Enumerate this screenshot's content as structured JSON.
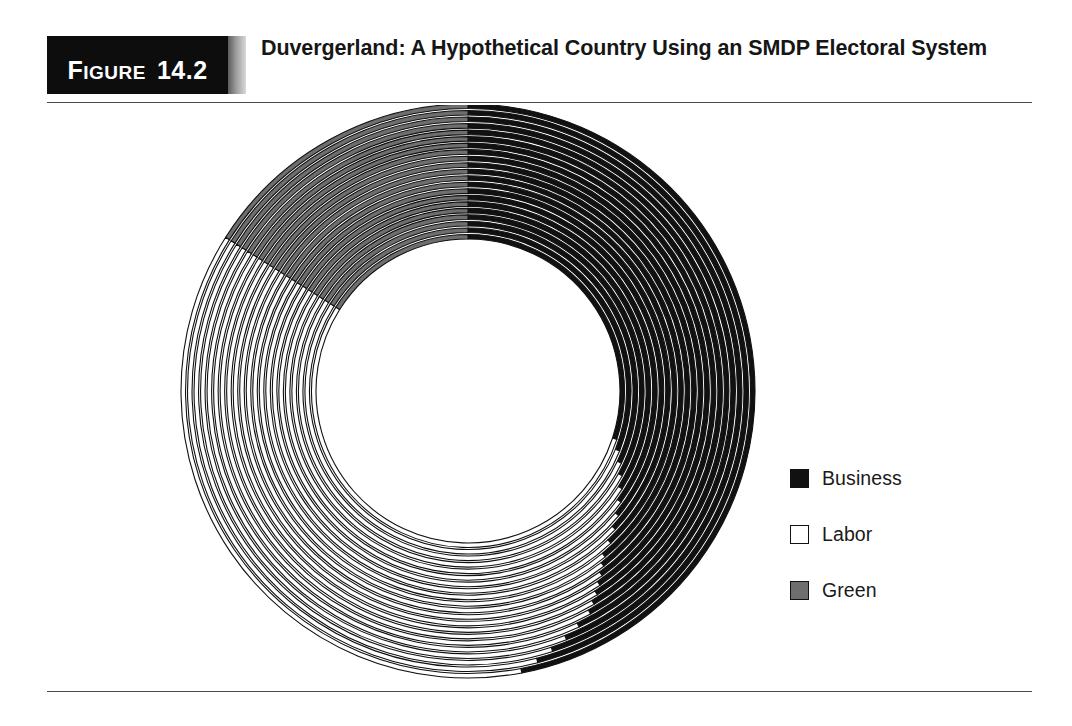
{
  "figure": {
    "tag_word": "Figure",
    "tag_word_lead": "F",
    "tag_word_rest": "IGURE",
    "tag_number": "14.2",
    "title": "Duvergerland: A Hypothetical Country Using an SMDP Electoral System"
  },
  "legend": {
    "items": [
      {
        "label": "Business",
        "color": "#111111",
        "swatch": "solid-black"
      },
      {
        "label": "Labor",
        "color": "#ffffff",
        "swatch": "outline-white"
      },
      {
        "label": "Green",
        "color": "#6e6e6e",
        "swatch": "solid-gray"
      }
    ]
  },
  "chart_data": {
    "type": "pie",
    "variant": "concentric-rings",
    "title": "Duvergerland: A Hypothetical Country Using an SMDP Electoral System",
    "legend_position": "right",
    "center_x": 468,
    "center_y": 391,
    "inner_radius": 150,
    "outer_radius": 287,
    "ring_count": 21,
    "ring_gap": 2.0,
    "categories": [
      "Business",
      "Labor",
      "Green"
    ],
    "colors": {
      "Business": "#111111",
      "Labor": "#ffffff",
      "Green": "#6e6e6e",
      "stroke": "#111111",
      "background": "#ffffff"
    },
    "aggregate_shares_percent": {
      "Business": 39,
      "Labor": 45,
      "Green": 16
    },
    "rings": [
      {
        "index": 1,
        "label": "District 1",
        "shares_percent": {
          "Business": 47.0,
          "Labor": 37.0,
          "Green": 16.0
        }
      },
      {
        "index": 2,
        "label": "District 2",
        "shares_percent": {
          "Business": 46.0,
          "Labor": 38.0,
          "Green": 16.0
        }
      },
      {
        "index": 3,
        "label": "District 3",
        "shares_percent": {
          "Business": 45.0,
          "Labor": 39.0,
          "Green": 16.0
        }
      },
      {
        "index": 4,
        "label": "District 4",
        "shares_percent": {
          "Business": 44.0,
          "Labor": 40.0,
          "Green": 16.0
        }
      },
      {
        "index": 5,
        "label": "District 5",
        "shares_percent": {
          "Business": 43.0,
          "Labor": 41.0,
          "Green": 16.0
        }
      },
      {
        "index": 6,
        "label": "District 6",
        "shares_percent": {
          "Business": 42.0,
          "Labor": 42.0,
          "Green": 16.0
        }
      },
      {
        "index": 7,
        "label": "District 7",
        "shares_percent": {
          "Business": 41.5,
          "Labor": 42.5,
          "Green": 16.0
        }
      },
      {
        "index": 8,
        "label": "District 8",
        "shares_percent": {
          "Business": 41.0,
          "Labor": 43.0,
          "Green": 16.0
        }
      },
      {
        "index": 9,
        "label": "District 9",
        "shares_percent": {
          "Business": 40.5,
          "Labor": 43.5,
          "Green": 16.0
        }
      },
      {
        "index": 10,
        "label": "District 10",
        "shares_percent": {
          "Business": 40.0,
          "Labor": 44.0,
          "Green": 16.0
        }
      },
      {
        "index": 11,
        "label": "District 11",
        "shares_percent": {
          "Business": 39.5,
          "Labor": 44.5,
          "Green": 16.0
        }
      },
      {
        "index": 12,
        "label": "District 12",
        "shares_percent": {
          "Business": 39.0,
          "Labor": 45.0,
          "Green": 16.0
        }
      },
      {
        "index": 13,
        "label": "District 13",
        "shares_percent": {
          "Business": 38.0,
          "Labor": 46.0,
          "Green": 16.0
        }
      },
      {
        "index": 14,
        "label": "District 14",
        "shares_percent": {
          "Business": 37.0,
          "Labor": 47.0,
          "Green": 16.0
        }
      },
      {
        "index": 15,
        "label": "District 15",
        "shares_percent": {
          "Business": 36.0,
          "Labor": 48.0,
          "Green": 16.0
        }
      },
      {
        "index": 16,
        "label": "District 16",
        "shares_percent": {
          "Business": 35.0,
          "Labor": 49.0,
          "Green": 16.0
        }
      },
      {
        "index": 17,
        "label": "District 17",
        "shares_percent": {
          "Business": 34.0,
          "Labor": 50.0,
          "Green": 16.0
        }
      },
      {
        "index": 18,
        "label": "District 18",
        "shares_percent": {
          "Business": 33.0,
          "Labor": 51.0,
          "Green": 16.0
        }
      },
      {
        "index": 19,
        "label": "District 19",
        "shares_percent": {
          "Business": 32.0,
          "Labor": 52.0,
          "Green": 16.0
        }
      },
      {
        "index": 20,
        "label": "District 20",
        "shares_percent": {
          "Business": 31.0,
          "Labor": 53.0,
          "Green": 16.0
        }
      },
      {
        "index": 21,
        "label": "District 21",
        "shares_percent": {
          "Business": 30.0,
          "Labor": 54.0,
          "Green": 16.0
        }
      }
    ]
  }
}
